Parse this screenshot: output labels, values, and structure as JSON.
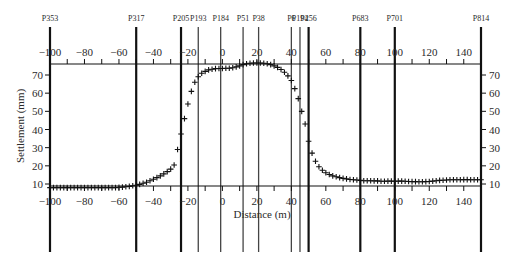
{
  "chart_data": {
    "type": "scatter",
    "title": "",
    "xlabel": "Distance (m)",
    "ylabel": "Settlement (mm)",
    "xlim": [
      -100,
      150
    ],
    "ylim": [
      7,
      77
    ],
    "x_ticks": [
      -100,
      -80,
      -60,
      -40,
      -20,
      0,
      20,
      40,
      60,
      80,
      100,
      120,
      140
    ],
    "y_ticks": [
      10,
      20,
      30,
      40,
      50,
      60,
      70
    ],
    "grid": false,
    "legend": null,
    "marker": "+",
    "piles": [
      {
        "label": "P353",
        "x": -100,
        "weight": "bold"
      },
      {
        "label": "P317",
        "x": -50,
        "weight": "bold"
      },
      {
        "label": "P205",
        "x": -24,
        "weight": "bold"
      },
      {
        "label": "P193",
        "x": -14,
        "weight": "light"
      },
      {
        "label": "P184",
        "x": -1,
        "weight": "light"
      },
      {
        "label": "P51",
        "x": 12,
        "weight": "light"
      },
      {
        "label": "P38",
        "x": 21,
        "weight": "light"
      },
      {
        "label": "P6",
        "x": 40,
        "weight": "light"
      },
      {
        "label": "P194",
        "x": 45,
        "weight": "light"
      },
      {
        "label": "P256",
        "x": 50,
        "weight": "bold"
      },
      {
        "label": "P683",
        "x": 80,
        "weight": "bold"
      },
      {
        "label": "P701",
        "x": 100,
        "weight": "bold"
      },
      {
        "label": "P814",
        "x": 150,
        "weight": "bold"
      }
    ],
    "series": [
      {
        "name": "Settlement",
        "x": [
          -100,
          -98,
          -96,
          -94,
          -92,
          -90,
          -88,
          -86,
          -84,
          -82,
          -80,
          -78,
          -76,
          -74,
          -72,
          -70,
          -68,
          -66,
          -64,
          -62,
          -60,
          -58,
          -56,
          -54,
          -52,
          -50,
          -48,
          -46,
          -44,
          -42,
          -40,
          -38,
          -36,
          -34,
          -32,
          -30,
          -28,
          -26,
          -24,
          -22,
          -20,
          -18,
          -16,
          -14,
          -12,
          -10,
          -8,
          -6,
          -4,
          -2,
          0,
          2,
          4,
          6,
          8,
          10,
          12,
          14,
          16,
          18,
          20,
          22,
          24,
          26,
          28,
          30,
          32,
          34,
          36,
          38,
          40,
          42,
          44,
          46,
          48,
          50,
          52,
          54,
          56,
          58,
          60,
          62,
          64,
          66,
          68,
          70,
          72,
          74,
          76,
          78,
          80,
          82,
          84,
          86,
          88,
          90,
          92,
          94,
          96,
          98,
          100,
          102,
          104,
          106,
          108,
          110,
          112,
          114,
          116,
          118,
          120,
          122,
          124,
          126,
          128,
          130,
          132,
          134,
          136,
          138,
          140,
          142,
          144,
          146,
          148,
          150
        ],
        "y": [
          8,
          8,
          8,
          8,
          8,
          8,
          8,
          8,
          8,
          8,
          8,
          8,
          8,
          8,
          8,
          8,
          8,
          8,
          8,
          8,
          8.2,
          8.3,
          8.5,
          8.7,
          9,
          9.3,
          9.8,
          10.4,
          11,
          11.8,
          12.6,
          13.5,
          14.5,
          15.6,
          16.8,
          18.2,
          20.5,
          29,
          37.5,
          46,
          54,
          61,
          66,
          69,
          71,
          72,
          72.8,
          73.2,
          73.5,
          73.6,
          73.6,
          73.7,
          73.7,
          74,
          74.5,
          75,
          75.7,
          76.2,
          76.5,
          76.6,
          76.6,
          76.6,
          76.5,
          76.2,
          75.7,
          75,
          74.2,
          73,
          71.5,
          69.5,
          67,
          62.5,
          57,
          50,
          43,
          33.5,
          27,
          22.5,
          19.5,
          17.6,
          16.2,
          15.2,
          14.5,
          14,
          13.5,
          13.1,
          12.8,
          12.5,
          12.3,
          12.2,
          12,
          11.8,
          11.8,
          11.8,
          11.7,
          11.7,
          11.5,
          11.5,
          11.6,
          11.6,
          11.5,
          11.6,
          11.6,
          11.5,
          11.4,
          11.3,
          11.3,
          11.2,
          11.2,
          11.3,
          11.4,
          11.6,
          11.8,
          12,
          12.1,
          12.2,
          12.3,
          12.3,
          12.3,
          12.3,
          12.4,
          12.4,
          12.3,
          12.3,
          12.3,
          12.3
        ]
      }
    ]
  }
}
